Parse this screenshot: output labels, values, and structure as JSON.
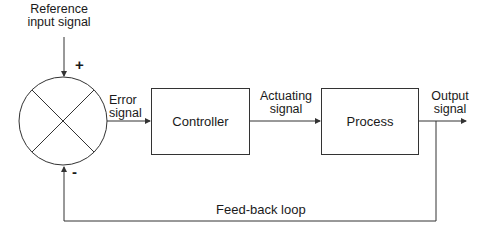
{
  "diagram": {
    "type": "block-diagram",
    "input_label": [
      "Reference",
      "input signal"
    ],
    "summing_junction": {
      "plus_sign": "+",
      "minus_sign": "-"
    },
    "error_label": [
      "Error",
      "signal"
    ],
    "blocks": [
      {
        "id": "controller",
        "label": "Controller"
      },
      {
        "id": "process",
        "label": "Process"
      }
    ],
    "actuating_label": [
      "Actuating",
      "signal"
    ],
    "output_label": [
      "Output",
      "signal"
    ],
    "feedback_label": "Feed-back loop",
    "edges": [
      {
        "from": "reference-input",
        "to": "summing-junction",
        "sign": "+"
      },
      {
        "from": "summing-junction",
        "to": "controller",
        "label": "Error signal"
      },
      {
        "from": "controller",
        "to": "process",
        "label": "Actuating signal"
      },
      {
        "from": "process",
        "to": "output",
        "label": "Output signal"
      },
      {
        "from": "output",
        "to": "summing-junction",
        "label": "Feed-back loop",
        "sign": "-"
      }
    ],
    "colors": {
      "line": "#333333",
      "background": "#ffffff",
      "text": "#1a1a1a"
    }
  }
}
